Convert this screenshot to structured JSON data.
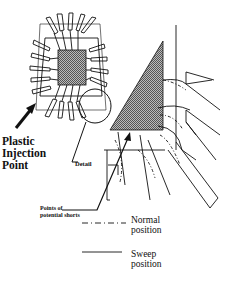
{
  "labels": {
    "injection_point": "Plastic Injection Point",
    "detail": "Detail",
    "potential_shorts": "Points of potential shorts"
  },
  "legend": {
    "items": [
      {
        "style": "dash-dot",
        "label": "Normal position"
      },
      {
        "style": "solid",
        "label": "Sweep position"
      }
    ]
  },
  "colors": {
    "line": "#111111",
    "die_fill": "#888888",
    "background": "#ffffff"
  }
}
